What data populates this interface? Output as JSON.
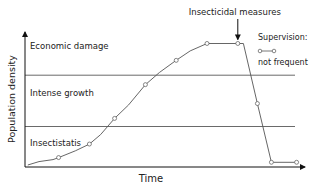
{
  "chart_data": {
    "type": "line",
    "title": "",
    "xlabel": "Time",
    "ylabel": "Population density",
    "xlim": [
      0,
      100
    ],
    "ylim": [
      0,
      100
    ],
    "grid": false,
    "ticks": false,
    "thresholds": [
      {
        "name": "economic-damage-threshold",
        "y": 68
      },
      {
        "name": "insectistatis-threshold",
        "y": 30
      }
    ],
    "zone_labels": [
      {
        "name": "zone-economic-damage",
        "text": "Economic damage",
        "y": 90
      },
      {
        "name": "zone-intense-growth",
        "text": "Intense growth",
        "y": 55
      },
      {
        "name": "zone-insectistatis",
        "text": "Insectistatis",
        "y": 18
      }
    ],
    "series": [
      {
        "name": "not frequent",
        "x": [
          1,
          12,
          23,
          32,
          43,
          54,
          65,
          76,
          83,
          88,
          97
        ],
        "y": [
          1.5,
          7,
          17,
          36,
          61,
          79,
          91.5,
          91.5,
          47,
          3.5,
          3.5
        ],
        "markers": [
          false,
          true,
          true,
          true,
          true,
          true,
          true,
          true,
          true,
          true,
          true
        ],
        "curve_path_points": [
          [
            1,
            1.5
          ],
          [
            5,
            4
          ],
          [
            10,
            5.5
          ],
          [
            12,
            7
          ],
          [
            18,
            12
          ],
          [
            23,
            17
          ],
          [
            27,
            24
          ],
          [
            32,
            36
          ],
          [
            37,
            46
          ],
          [
            43,
            61
          ],
          [
            48,
            70
          ],
          [
            54,
            79
          ],
          [
            59,
            86
          ],
          [
            65,
            91.5
          ],
          [
            76,
            91.5
          ],
          [
            78,
            91.5
          ],
          [
            83,
            47
          ],
          [
            88,
            3.5
          ],
          [
            97,
            3.5
          ]
        ]
      }
    ],
    "annotations": [
      {
        "name": "insecticidal-measures",
        "text": "Insecticidal measures",
        "arrow_to": [
          76,
          91.5
        ]
      }
    ],
    "legend": {
      "title": "Supervision:",
      "entries": [
        {
          "label": "not frequent",
          "symbol": "line-with-circle-markers"
        }
      ],
      "placement": "top-right"
    }
  }
}
